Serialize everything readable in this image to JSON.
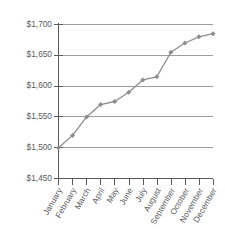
{
  "chart_data": {
    "type": "line",
    "title": "",
    "subtitle": "",
    "xlabel": "",
    "ylabel": "",
    "categories": [
      "January",
      "February",
      "March",
      "April",
      "May",
      "June",
      "July",
      "August",
      "September",
      "October",
      "November",
      "December"
    ],
    "values": [
      1500,
      1520,
      1550,
      1570,
      1575,
      1590,
      1610,
      1615,
      1655,
      1670,
      1680,
      1685
    ],
    "series": [
      {
        "name": "",
        "values": [
          1500,
          1520,
          1550,
          1570,
          1575,
          1590,
          1610,
          1615,
          1655,
          1670,
          1680,
          1685
        ]
      }
    ],
    "ylim": [
      1450,
      1700
    ],
    "ytick_values": [
      1450,
      1500,
      1550,
      1600,
      1650,
      1700
    ],
    "ytick_labels": [
      "$1,450",
      "$1,500",
      "$1,550",
      "$1,600",
      "$1,650",
      "$1,700"
    ],
    "grid": true,
    "grid_axis": "y",
    "legend": false,
    "legend_position": "none",
    "marker": "diamond",
    "xtick_label_rotation": -60,
    "colors": {
      "line": "#8d8d8d",
      "marker": "#8d8d8d",
      "gridline": "#9d9d9d",
      "axis": "#58595b",
      "text": "#58595b",
      "background": "#ffffff"
    }
  }
}
